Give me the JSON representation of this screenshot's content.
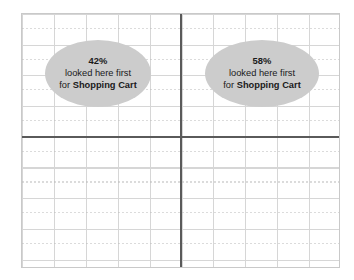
{
  "figure": {
    "type": "quadrant-grid-annotation",
    "background_color": "#ffffff",
    "frame_color": "#c9c9c9",
    "grid_minor_color": "#d6d6d6",
    "axis_color": "#5a5a5a",
    "callout_fill": "#cccccc",
    "text_color": "#1a1a1a"
  },
  "callouts": [
    {
      "id": "left-quadrant-callout",
      "percent": "42%",
      "line2": "looked here first",
      "line3_prefix": "for ",
      "line3_emphasis": "Shopping Cart"
    },
    {
      "id": "right-quadrant-callout",
      "percent": "58%",
      "line2": "looked here first",
      "line3_prefix": "for ",
      "line3_emphasis": "Shopping Cart"
    }
  ],
  "chart_data": {
    "type": "pie",
    "title": "",
    "subtitle": "",
    "xlabel": "",
    "ylabel": "",
    "categories": [
      "Left region",
      "Right region"
    ],
    "values": [
      42,
      58
    ],
    "value_unit": "%",
    "annotations": [
      "42% looked here first for Shopping Cart",
      "58% looked here first for Shopping Cart"
    ],
    "legend_position": "none",
    "grid": true
  }
}
